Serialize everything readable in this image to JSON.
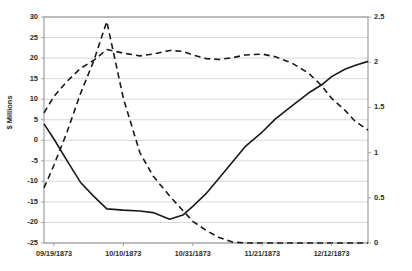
{
  "chart_data": {
    "type": "line",
    "title": "",
    "subtitle": "",
    "xlabel": "",
    "ylabel": "$ Millions",
    "y2label": "",
    "grid": true,
    "legend": "none",
    "x_tick_labels": [
      "09/19/1873",
      "10/10/1873",
      "10/31/1873",
      "11/21/1873",
      "12/12/1873"
    ],
    "x_tick_positions": [
      3,
      24,
      45,
      66,
      87
    ],
    "x_range": [
      0,
      98
    ],
    "ylim": [
      -25,
      30
    ],
    "y_ticks": [
      30,
      25,
      20,
      15,
      10,
      5,
      0,
      -5,
      -10,
      -15,
      -20,
      -25
    ],
    "y_tick_labels": [
      "30",
      "25",
      "20",
      "15",
      "10",
      "5",
      "0",
      "-5",
      "-10",
      "-15",
      "-20",
      "-25"
    ],
    "y2lim": [
      0,
      2.5
    ],
    "y2_ticks": [
      2.5,
      2,
      1.5,
      1,
      0.5,
      0
    ],
    "y2_tick_labels": [
      "2.5",
      "2",
      "1.5",
      "1",
      "0.5",
      "0"
    ],
    "series": [
      {
        "name": "solid-series",
        "axis": "left",
        "style": "solid",
        "color": "#1a1a1a",
        "width": 1.6,
        "x": [
          0,
          3,
          7,
          11,
          15,
          19,
          24,
          29,
          33,
          38,
          42,
          45,
          49,
          53,
          57,
          61,
          66,
          70,
          75,
          80,
          84,
          87,
          91,
          94,
          98
        ],
        "y": [
          4.0,
          0.3,
          -5.0,
          -10.2,
          -13.6,
          -16.7,
          -17.0,
          -17.2,
          -17.6,
          -19.2,
          -18.2,
          -16.1,
          -13.0,
          -9.2,
          -5.3,
          -1.4,
          2.0,
          5.2,
          8.4,
          11.5,
          13.5,
          15.5,
          17.3,
          18.2,
          19.2
        ]
      },
      {
        "name": "upper-dashed-series",
        "axis": "right",
        "style": "dashed",
        "color": "#1a1a1a",
        "width": 1.6,
        "x": [
          0,
          3,
          7,
          11,
          15,
          19,
          24,
          29,
          33,
          38,
          42,
          45,
          49,
          53,
          57,
          61,
          66,
          70,
          75,
          80,
          84,
          87,
          91,
          94,
          98
        ],
        "y": [
          1.44,
          1.62,
          1.79,
          1.93,
          2.02,
          2.14,
          2.1,
          2.07,
          2.09,
          2.13,
          2.12,
          2.08,
          2.04,
          2.03,
          2.05,
          2.08,
          2.09,
          2.06,
          1.99,
          1.88,
          1.74,
          1.6,
          1.47,
          1.35,
          1.25
        ]
      },
      {
        "name": "lower-dashed-series",
        "axis": "right",
        "style": "dashed",
        "color": "#1a1a1a",
        "width": 1.6,
        "x": [
          0,
          3,
          7,
          11,
          15,
          19,
          24,
          29,
          33,
          38,
          42,
          45,
          49,
          53,
          57,
          61,
          66,
          70,
          75,
          80,
          84,
          87,
          91,
          94,
          98
        ],
        "y": [
          0.61,
          0.86,
          1.23,
          1.65,
          2.01,
          2.45,
          1.6,
          1.0,
          0.74,
          0.52,
          0.36,
          0.24,
          0.14,
          0.06,
          0.01,
          0.0,
          0.0,
          0.0,
          0.0,
          0.0,
          0.0,
          0.0,
          0.0,
          0.0,
          0.0
        ]
      }
    ]
  },
  "plot": {
    "border_color": "#808080",
    "grid_color": "#d4d4d4",
    "background": "#ffffff"
  }
}
